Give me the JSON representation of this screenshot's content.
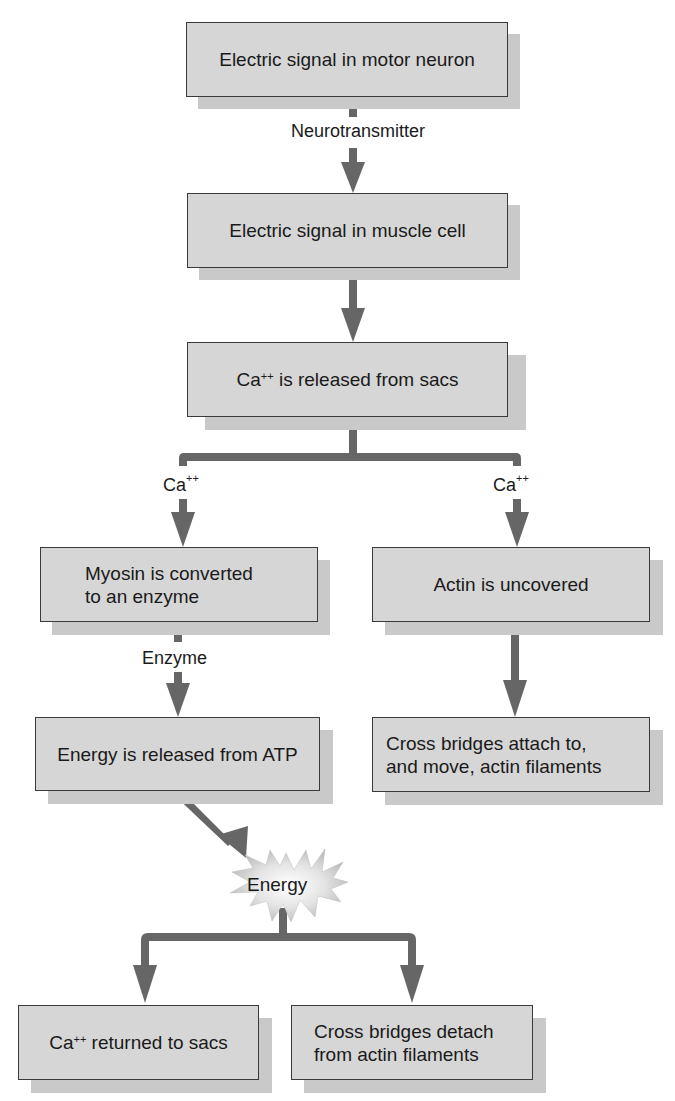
{
  "diagram": {
    "colors": {
      "box_fill": "#d6d6d6",
      "box_border": "#3a3a3a",
      "shadow": "#c9c9c9",
      "arrow": "#666666",
      "background": "#ffffff"
    },
    "boxes": {
      "motor_neuron": {
        "text": "Electric signal in motor neuron"
      },
      "muscle_cell": {
        "text": "Electric signal in muscle cell"
      },
      "ca_released": {
        "prefix": "Ca",
        "sup": "++",
        "suffix": " is released from sacs"
      },
      "myosin": {
        "line1": "Myosin is converted",
        "line2": "to an enzyme"
      },
      "actin_uncovered": {
        "text": "Actin is uncovered"
      },
      "energy_atp": {
        "text": "Energy is released from ATP"
      },
      "cross_attach": {
        "line1": "Cross bridges attach to,",
        "line2": "and move, actin filaments"
      },
      "ca_returned": {
        "prefix": "Ca",
        "sup": "++",
        "suffix": " returned to sacs"
      },
      "cross_detach": {
        "line1": "Cross bridges detach",
        "line2": "from actin filaments"
      }
    },
    "labels": {
      "neurotransmitter": "Neurotransmitter",
      "ca_left": {
        "base": "Ca",
        "sup": "++"
      },
      "ca_right": {
        "base": "Ca",
        "sup": "++"
      },
      "enzyme": "Enzyme",
      "energy_burst": "Energy"
    }
  }
}
